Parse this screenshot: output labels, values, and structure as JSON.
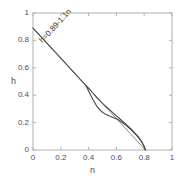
{
  "chart_data": {
    "type": "line",
    "title": "",
    "xlabel": "n",
    "ylabel": "h",
    "xlim": [
      0,
      1
    ],
    "ylim": [
      0,
      1
    ],
    "grid": false,
    "legend": null,
    "xticks": [
      "0",
      "0.2",
      "0.4",
      "0.6",
      "0.8",
      "1"
    ],
    "xtick_values": [
      0,
      0.2,
      0.4,
      0.6,
      0.8,
      1
    ],
    "yticks": [
      "0",
      "0.2",
      "0.4",
      "0.6",
      "0.8",
      "1"
    ],
    "ytick_values": [
      0,
      0.2,
      0.4,
      0.6,
      0.8,
      1
    ],
    "annotations": [
      {
        "text": "h=0.89-1.1n",
        "x": 0.06,
        "y": 0.82,
        "rotation": -47.5
      }
    ],
    "series": [
      {
        "name": "fit-line",
        "kind": "straight-line",
        "equation": "h = 0.89 - 1.1 n",
        "intercept": 0.89,
        "slope": -1.1,
        "color": "#7a7a7a",
        "x": [
          0.0,
          0.809
        ],
        "values": [
          0.89,
          0.0
        ]
      },
      {
        "name": "data-branch-upper",
        "kind": "curve",
        "color": "#4a4a4a",
        "x": [
          0.0,
          0.1,
          0.2,
          0.3,
          0.38,
          0.41,
          0.44,
          0.47,
          0.5,
          0.53,
          0.56,
          0.59,
          0.62,
          0.65,
          0.68,
          0.71,
          0.74,
          0.76,
          0.78,
          0.8,
          0.809
        ],
        "values": [
          0.89,
          0.78,
          0.67,
          0.56,
          0.472,
          0.44,
          0.405,
          0.372,
          0.34,
          0.312,
          0.285,
          0.258,
          0.232,
          0.205,
          0.177,
          0.148,
          0.116,
          0.092,
          0.064,
          0.026,
          0.0
        ]
      },
      {
        "name": "data-branch-lower",
        "kind": "curve",
        "color": "#4a4a4a",
        "x": [
          0.38,
          0.4,
          0.43,
          0.46,
          0.49,
          0.52,
          0.55,
          0.58,
          0.61,
          0.64,
          0.67,
          0.7,
          0.73,
          0.76,
          0.78,
          0.8,
          0.809
        ],
        "values": [
          0.472,
          0.43,
          0.37,
          0.318,
          0.283,
          0.262,
          0.248,
          0.236,
          0.222,
          0.203,
          0.18,
          0.153,
          0.124,
          0.09,
          0.062,
          0.025,
          0.0
        ]
      }
    ],
    "axes_box": {
      "left": 33,
      "right": 172,
      "top": 13,
      "bottom": 150,
      "border_color": "#b0b0b0",
      "background": "#ffffff"
    }
  }
}
